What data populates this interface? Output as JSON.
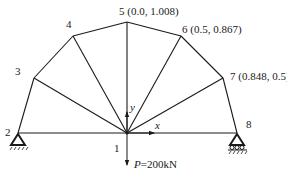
{
  "diagram": {
    "nodes": [
      {
        "id": "1",
        "label": "1"
      },
      {
        "id": "2",
        "label": "2"
      },
      {
        "id": "3",
        "label": "3"
      },
      {
        "id": "4",
        "label": "4"
      },
      {
        "id": "5",
        "label": "5 (0.0, 1.008)"
      },
      {
        "id": "6",
        "label": "6 (0.5, 0.867)"
      },
      {
        "id": "7",
        "label": "7 (0.848, 0.5)"
      },
      {
        "id": "8",
        "label": "8"
      }
    ],
    "axes": {
      "x": "x",
      "y": "y"
    },
    "load": {
      "symbol": "P",
      "value": "=200kN"
    },
    "colors": {
      "line": "#1a1a1a",
      "background": "#ffffff"
    }
  }
}
